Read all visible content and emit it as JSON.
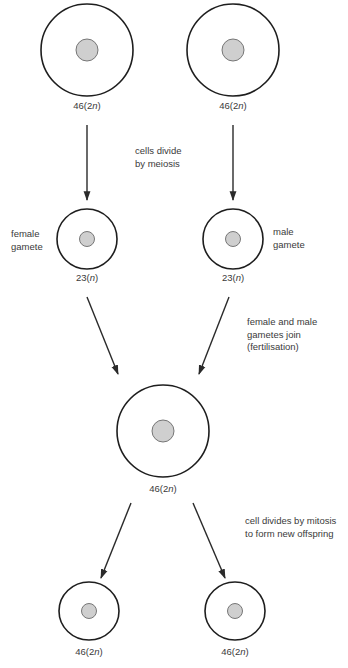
{
  "diagram": {
    "title": "",
    "colors": {
      "outline": "#1e1e1e",
      "nucleus_fill": "#cfcfcf",
      "nucleus_stroke": "#6a6a6a",
      "text": "#3a3a3a",
      "arrow": "#2a2a2a"
    },
    "cells": [
      {
        "id": "parent-left",
        "label_num": "46(2",
        "label_n": "n",
        "label_close": ")",
        "side_label": ""
      },
      {
        "id": "parent-right",
        "label_num": "46(2",
        "label_n": "n",
        "label_close": ")",
        "side_label": ""
      },
      {
        "id": "female-gamete",
        "label_num": "23(",
        "label_n": "n",
        "label_close": ")",
        "side_label_line1": "female",
        "side_label_line2": "gamete"
      },
      {
        "id": "male-gamete",
        "label_num": "23(",
        "label_n": "n",
        "label_close": ")",
        "side_label_line1": "male",
        "side_label_line2": "gamete"
      },
      {
        "id": "zygote",
        "label_num": "46(2",
        "label_n": "n",
        "label_close": ")",
        "side_label": ""
      },
      {
        "id": "offspring-left",
        "label_num": "46(2",
        "label_n": "n",
        "label_close": ")",
        "side_label": ""
      },
      {
        "id": "offspring-right",
        "label_num": "46(2",
        "label_n": "n",
        "label_close": ")",
        "side_label": ""
      }
    ],
    "steps": [
      {
        "id": "meiosis",
        "line1": "cells divide",
        "line2": "by meiosis"
      },
      {
        "id": "fertilisation",
        "line1": "female and male",
        "line2": "gametes join",
        "line3": "(fertilisation)"
      },
      {
        "id": "mitosis",
        "line1": "cell divides by mitosis",
        "line2": "to form new offspring"
      }
    ]
  }
}
